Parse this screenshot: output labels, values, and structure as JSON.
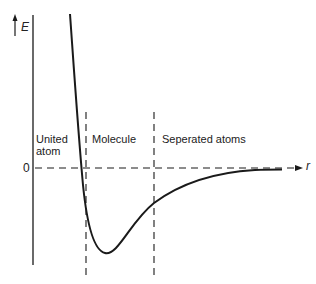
{
  "diagram": {
    "y_axis_label": "E",
    "x_axis_label": "r",
    "zero_label": "0",
    "regions": [
      {
        "line1": "United",
        "line2": "atom"
      },
      {
        "line1": "Molecule"
      },
      {
        "line1": "Seperated atoms"
      }
    ],
    "colors": {
      "line": "#1a1a1a",
      "background": "#ffffff"
    }
  }
}
